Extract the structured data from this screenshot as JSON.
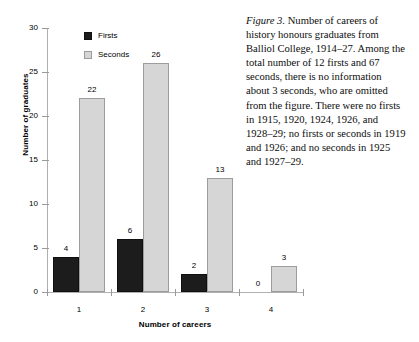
{
  "chart_data": {
    "type": "bar",
    "title": "",
    "xlabel": "Number of careers",
    "ylabel": "Number of graduates",
    "categories": [
      "1",
      "2",
      "3",
      "4"
    ],
    "series": [
      {
        "name": "Firsts",
        "values": [
          4,
          6,
          2,
          0
        ],
        "color": "#1c1c1c"
      },
      {
        "name": "Seconds",
        "values": [
          22,
          26,
          13,
          3
        ],
        "color": "#d6d6d6"
      }
    ],
    "ylim": [
      0,
      30
    ],
    "yticks": [
      0,
      5,
      10,
      15,
      20,
      25,
      30
    ],
    "ytick_labels": [
      "0",
      "5",
      "10",
      "15",
      "20",
      "25",
      "30"
    ],
    "grid": false,
    "legend_position": "top-left-inside",
    "data_labels": true
  },
  "axes": {
    "y_title": "Number of graduates",
    "x_title": "Number of careers"
  },
  "legend": {
    "entries": [
      {
        "label": "Firsts",
        "swatch": "black-square"
      },
      {
        "label": "Seconds",
        "swatch": "light-gray-square"
      }
    ]
  },
  "caption": {
    "figure_label": "Figure 3.",
    "text": " Number of careers of history honours graduates from Balliol College, 1914–27. Among the total number of 12 firsts and 67 seconds, there is no information about 3 seconds, who are omitted from the figure. There were no firsts in 1915, 1920, 1924, 1926, and 1928–29; no firsts or seconds in 1919 and 1926; and no seconds in 1925 and 1927–29."
  }
}
